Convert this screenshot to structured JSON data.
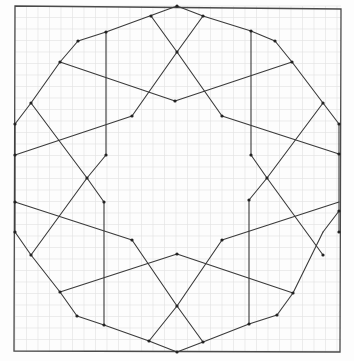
{
  "diagram": {
    "background": "#fdfdfd",
    "grid": {
      "spacing": 11.5,
      "color": "#e4e4e4",
      "x0": 15,
      "y0": 6,
      "x1": 341,
      "y1": 352
    },
    "ink": "#3a3a3a",
    "frame": [
      [
        15,
        6
      ],
      [
        341,
        9
      ],
      [
        340,
        352
      ],
      [
        14,
        351
      ]
    ],
    "segments": [
      [
        [
          15,
          124
        ],
        [
          31,
          103
        ]
      ],
      [
        [
          31,
          103
        ],
        [
          60,
          62
        ]
      ],
      [
        [
          60,
          62
        ],
        [
          78,
          41
        ]
      ],
      [
        [
          78,
          41
        ],
        [
          106,
          32
        ]
      ],
      [
        [
          106,
          32
        ],
        [
          177,
          6
        ]
      ],
      [
        [
          177,
          6
        ],
        [
          203,
          16
        ]
      ],
      [
        [
          203,
          16
        ],
        [
          251,
          31
        ]
      ],
      [
        [
          251,
          31
        ],
        [
          275,
          41
        ]
      ],
      [
        [
          275,
          41
        ],
        [
          292,
          62
        ]
      ],
      [
        [
          292,
          62
        ],
        [
          323,
          103
        ]
      ],
      [
        [
          323,
          103
        ],
        [
          339,
          124
        ]
      ],
      [
        [
          339,
          124
        ],
        [
          339,
          154
        ]
      ],
      [
        [
          15,
          124
        ],
        [
          15,
          232
        ]
      ],
      [
        [
          339,
          154
        ],
        [
          339,
          232
        ]
      ],
      [
        [
          15,
          232
        ],
        [
          31,
          255
        ]
      ],
      [
        [
          31,
          255
        ],
        [
          60,
          292
        ]
      ],
      [
        [
          60,
          292
        ],
        [
          77,
          316
        ]
      ],
      [
        [
          77,
          316
        ],
        [
          104,
          325
        ]
      ],
      [
        [
          104,
          325
        ],
        [
          149,
          341
        ]
      ],
      [
        [
          149,
          341
        ],
        [
          177,
          352
        ]
      ],
      [
        [
          177,
          352
        ],
        [
          203,
          342
        ]
      ],
      [
        [
          203,
          342
        ],
        [
          249,
          324
        ]
      ],
      [
        [
          249,
          324
        ],
        [
          277,
          315
        ]
      ],
      [
        [
          277,
          315
        ],
        [
          293,
          293
        ]
      ],
      [
        [
          293,
          293
        ],
        [
          323,
          232
        ]
      ],
      [
        [
          323,
          232
        ],
        [
          339,
          211
        ]
      ],
      [
        [
          106,
          32
        ],
        [
          106,
          155
        ]
      ],
      [
        [
          106,
          155
        ],
        [
          87,
          178
        ]
      ],
      [
        [
          251,
          31
        ],
        [
          251,
          155
        ]
      ],
      [
        [
          251,
          155
        ],
        [
          267,
          178
        ]
      ],
      [
        [
          104,
          202
        ],
        [
          104,
          325
        ]
      ],
      [
        [
          104,
          202
        ],
        [
          87,
          178
        ]
      ],
      [
        [
          249,
          200
        ],
        [
          249,
          324
        ]
      ],
      [
        [
          249,
          200
        ],
        [
          267,
          178
        ]
      ],
      [
        [
          60,
          62
        ],
        [
          175,
          101
        ]
      ],
      [
        [
          175,
          101
        ],
        [
          292,
          62
        ]
      ],
      [
        [
          15,
          155
        ],
        [
          132,
          116
        ]
      ],
      [
        [
          132,
          116
        ],
        [
          177,
          52
        ]
      ],
      [
        [
          177,
          52
        ],
        [
          151,
          16
        ]
      ],
      [
        [
          177,
          52
        ],
        [
          203,
          16
        ]
      ],
      [
        [
          177,
          52
        ],
        [
          222,
          116
        ]
      ],
      [
        [
          222,
          116
        ],
        [
          339,
          154
        ]
      ],
      [
        [
          31,
          103
        ],
        [
          87,
          178
        ]
      ],
      [
        [
          87,
          178
        ],
        [
          31,
          255
        ]
      ],
      [
        [
          323,
          103
        ],
        [
          267,
          178
        ]
      ],
      [
        [
          267,
          178
        ],
        [
          323,
          255
        ]
      ],
      [
        [
          15,
          202
        ],
        [
          132,
          240
        ]
      ],
      [
        [
          132,
          240
        ],
        [
          177,
          306
        ]
      ],
      [
        [
          177,
          306
        ],
        [
          222,
          240
        ]
      ],
      [
        [
          222,
          240
        ],
        [
          339,
          202
        ]
      ],
      [
        [
          60,
          292
        ],
        [
          177,
          254
        ]
      ],
      [
        [
          177,
          254
        ],
        [
          293,
          293
        ]
      ],
      [
        [
          177,
          306
        ],
        [
          149,
          341
        ]
      ],
      [
        [
          177,
          306
        ],
        [
          203,
          342
        ]
      ]
    ],
    "vertices": [
      [
        78,
        41
      ],
      [
        106,
        32
      ],
      [
        177,
        6
      ],
      [
        203,
        16
      ],
      [
        251,
        31
      ],
      [
        275,
        41
      ],
      [
        60,
        62
      ],
      [
        292,
        62
      ],
      [
        31,
        103
      ],
      [
        323,
        103
      ],
      [
        15,
        124
      ],
      [
        339,
        124
      ],
      [
        15,
        155
      ],
      [
        339,
        154
      ],
      [
        132,
        116
      ],
      [
        222,
        116
      ],
      [
        175,
        101
      ],
      [
        177,
        52
      ],
      [
        151,
        16
      ],
      [
        106,
        155
      ],
      [
        251,
        155
      ],
      [
        87,
        178
      ],
      [
        267,
        178
      ],
      [
        104,
        202
      ],
      [
        249,
        200
      ],
      [
        15,
        202
      ],
      [
        339,
        211
      ],
      [
        15,
        232
      ],
      [
        339,
        232
      ],
      [
        31,
        255
      ],
      [
        323,
        255
      ],
      [
        132,
        240
      ],
      [
        222,
        240
      ],
      [
        177,
        254
      ],
      [
        177,
        306
      ],
      [
        60,
        292
      ],
      [
        293,
        293
      ],
      [
        77,
        316
      ],
      [
        277,
        315
      ],
      [
        104,
        325
      ],
      [
        249,
        324
      ],
      [
        149,
        341
      ],
      [
        203,
        342
      ],
      [
        177,
        352
      ]
    ]
  }
}
